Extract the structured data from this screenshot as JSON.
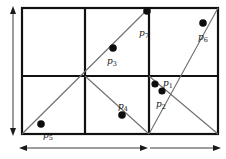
{
  "figure": {
    "background": "#ffffff",
    "stroke_dark": "#111111",
    "stroke_mid": "#555555",
    "stroke_light": "#7a7a7a",
    "point_fill": "#0d0d0d"
  },
  "rect": {
    "x": 22,
    "y": 8,
    "width": 196,
    "height": 126
  },
  "grid": {
    "vertical_lines_x": [
      85,
      149
    ],
    "horizontal_lines_y": [
      76
    ],
    "columns": 3,
    "rows": 2
  },
  "diagonals": [
    {
      "name": "lower-left-ascending",
      "x1": 22,
      "y1": 134,
      "x2": 149,
      "y2": 8
    },
    {
      "name": "right-cell-ascending",
      "x1": 149,
      "y1": 134,
      "x2": 218,
      "y2": 8
    },
    {
      "name": "center-descending",
      "x1": 85,
      "y1": 76,
      "x2": 149,
      "y2": 134
    },
    {
      "name": "right-descending",
      "x1": 149,
      "y1": 76,
      "x2": 218,
      "y2": 134
    }
  ],
  "points": [
    {
      "id": "p1",
      "label": "p",
      "sub": "1",
      "cx": 155,
      "cy": 84,
      "r": 3.6,
      "label_x": 163,
      "label_y": 79
    },
    {
      "id": "p2",
      "label": "p",
      "sub": "2",
      "cx": 162,
      "cy": 91,
      "r": 3.6,
      "label_x": 156,
      "label_y": 100
    },
    {
      "id": "p3",
      "label": "p",
      "sub": "3",
      "cx": 113,
      "cy": 48,
      "r": 3.8,
      "label_x": 107,
      "label_y": 57
    },
    {
      "id": "p4",
      "label": "p",
      "sub": "4",
      "cx": 122,
      "cy": 115,
      "r": 3.8,
      "label_x": 118,
      "label_y": 102
    },
    {
      "id": "p5",
      "label": "p",
      "sub": "5",
      "cx": 41,
      "cy": 124,
      "r": 3.8,
      "label_x": 43,
      "label_y": 131
    },
    {
      "id": "p6",
      "label": "p",
      "sub": "6",
      "cx": 203,
      "cy": 23,
      "r": 3.8,
      "label_x": 198,
      "label_y": 33
    },
    {
      "id": "p7",
      "label": "p",
      "sub": "7",
      "cx": 147,
      "cy": 11,
      "r": 3.8,
      "label_x": 139,
      "label_y": 29
    }
  ],
  "arrows": {
    "vertical": {
      "name": "height-extent-arrow",
      "x": 13,
      "y1": 10,
      "y2": 132,
      "double_headed": true
    },
    "horizontal": [
      {
        "name": "width-extent-arrow-left",
        "y": 148,
        "x1": 22,
        "x2": 145,
        "head_left": true,
        "head_right": true
      },
      {
        "name": "width-extent-arrow-right",
        "y": 148,
        "x1": 150,
        "x2": 218,
        "head_left": false,
        "head_right": true
      }
    ]
  }
}
